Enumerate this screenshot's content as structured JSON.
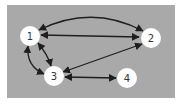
{
  "diagram": {
    "type": "directed-graph",
    "background_color": "#a9a9a9",
    "node_color": "#ffffff",
    "edge_color": "#1e1e1e",
    "label_color": "#333333",
    "nodes": [
      {
        "id": "1",
        "label": "1",
        "x": 30,
        "y": 36
      },
      {
        "id": "2",
        "label": "2",
        "x": 151,
        "y": 38
      },
      {
        "id": "3",
        "label": "3",
        "x": 54,
        "y": 76
      },
      {
        "id": "4",
        "label": "4",
        "x": 127,
        "y": 78
      }
    ],
    "edges": [
      {
        "from": "1",
        "to": "2",
        "bidirectional": true,
        "shape": "curved-top"
      },
      {
        "from": "1",
        "to": "2",
        "bidirectional": true,
        "shape": "straight"
      },
      {
        "from": "2",
        "to": "3",
        "bidirectional": true,
        "shape": "straight"
      },
      {
        "from": "1",
        "to": "3",
        "bidirectional": true,
        "shape": "curved-left"
      },
      {
        "from": "1",
        "to": "3",
        "bidirectional": true,
        "shape": "straight"
      },
      {
        "from": "3",
        "to": "4",
        "bidirectional": true,
        "shape": "straight"
      }
    ]
  }
}
